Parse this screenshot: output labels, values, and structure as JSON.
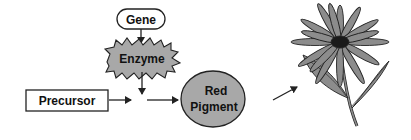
{
  "diagram": {
    "nodes": {
      "gene": {
        "label": "Gene",
        "shape": "rounded-rect"
      },
      "enzyme": {
        "label": "Enzyme",
        "shape": "starburst"
      },
      "precursor": {
        "label": "Precursor",
        "shape": "rect"
      },
      "red_pigment": {
        "label_line1": "Red",
        "label_line2": "Pigment",
        "shape": "ellipse"
      },
      "flower": {
        "label": "",
        "shape": "flower-illustration"
      }
    },
    "edges": [
      {
        "from": "gene",
        "to": "enzyme"
      },
      {
        "from": "enzyme",
        "to": "reaction-point"
      },
      {
        "from": "precursor",
        "to": "reaction-point"
      },
      {
        "from": "reaction-point",
        "to": "red_pigment"
      },
      {
        "from": "red_pigment",
        "to": "flower"
      }
    ],
    "colors": {
      "fill_gray": "#a8a8a8",
      "flower_gray": "#8c8c8c",
      "center_dark": "#1a1a1a",
      "stroke": "#222222",
      "background": "#ffffff"
    }
  }
}
